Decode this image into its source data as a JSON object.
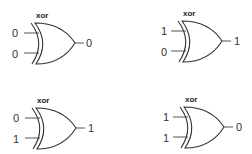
{
  "diagram": {
    "type": "logic-gate-truth-table",
    "gates": [
      {
        "label": "xor",
        "input_a": "0",
        "input_b": "0",
        "output": "0",
        "x": 0,
        "y": 0
      },
      {
        "label": "xor",
        "input_a": "1",
        "input_b": "0",
        "output": "1",
        "x": 147,
        "y": -2
      },
      {
        "label": "xor",
        "input_a": "0",
        "input_b": "1",
        "output": "1",
        "x": 1,
        "y": 85
      },
      {
        "label": "xor",
        "input_a": "1",
        "input_b": "1",
        "output": "0",
        "x": 149,
        "y": 84
      }
    ],
    "colors": {
      "stroke": "#333333",
      "text": "#333333",
      "background": "#ffffff"
    }
  }
}
